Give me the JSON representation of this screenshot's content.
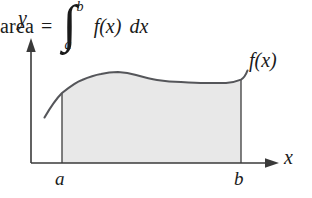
{
  "figure": {
    "background_color": "#ffffff",
    "ink_color": "#3a3a3a",
    "text_color": "#1a1a1a",
    "fill_color": "#e8e8e8",
    "axes": {
      "y_label": "y",
      "x_label": "x",
      "origin_x": 31,
      "origin_y": 163,
      "y_top": 38,
      "x_right": 279
    },
    "ticks": {
      "lower_limit_label": "a",
      "upper_limit_label": "b",
      "lower_limit_x": 62,
      "upper_limit_x": 241
    },
    "curve": {
      "label": "f(x)",
      "points": [
        [
          45,
          117
        ],
        [
          62,
          93
        ],
        [
          82,
          80
        ],
        [
          101,
          74
        ],
        [
          118,
          72
        ],
        [
          136,
          75
        ],
        [
          157,
          80
        ],
        [
          181,
          82
        ],
        [
          205,
          83
        ],
        [
          226,
          83
        ],
        [
          238,
          80
        ],
        [
          247,
          71
        ]
      ]
    },
    "region": {
      "name": "shaded-area",
      "left_boundary_x": 62,
      "right_boundary_x": 241,
      "baseline_y": 163
    },
    "expression": {
      "area_word": "area",
      "equals": "=",
      "integral_sign": "∫",
      "upper_limit": "b",
      "lower_limit": "a",
      "integrand": "f(x)",
      "differential": "dx"
    }
  }
}
